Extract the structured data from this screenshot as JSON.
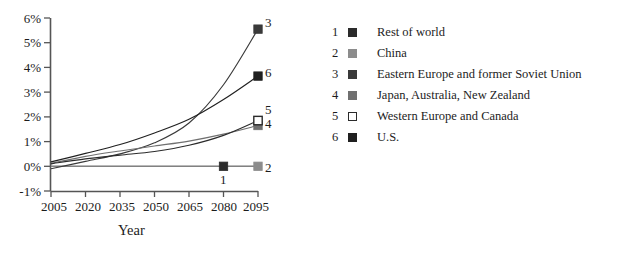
{
  "chart_data": {
    "type": "line",
    "title": "",
    "xlabel": "Year",
    "ylabel": "",
    "x": [
      2005,
      2020,
      2035,
      2050,
      2065,
      2080,
      2095
    ],
    "xlim": [
      2005,
      2095
    ],
    "ylim": [
      -1,
      6
    ],
    "yticks": [
      -1,
      0,
      1,
      2,
      3,
      4,
      5,
      6
    ],
    "ytick_labels": [
      "-1%",
      "0%",
      "1%",
      "2%",
      "3%",
      "4%",
      "5%",
      "6%"
    ],
    "xtick_labels": [
      "2005",
      "2020",
      "2035",
      "2050",
      "2065",
      "2080",
      "2095"
    ],
    "grid": false,
    "legend_position": "right",
    "series": [
      {
        "index": "1",
        "name": "Rest of world",
        "color": "#2b2b2b",
        "marker": "filled-square",
        "marker_fill": "#2b2b2b",
        "values": [
          0.0,
          0.0,
          0.0,
          0.0,
          0.0,
          0.0,
          0.0
        ],
        "end_marker_x": 2080,
        "end_marker_y": 0.0
      },
      {
        "index": "2",
        "name": "China",
        "color": "#8c8c8c",
        "marker": "filled-square",
        "marker_fill": "#8c8c8c",
        "values": [
          0.0,
          0.0,
          0.0,
          0.0,
          0.0,
          0.0,
          0.0
        ],
        "end_marker_x": 2095,
        "end_marker_y": 0.0
      },
      {
        "index": "3",
        "name": "Eastern Europe and former Soviet Union",
        "color": "#3a3a3a",
        "marker": "filled-square",
        "marker_fill": "#3a3a3a",
        "values": [
          -0.1,
          0.2,
          0.5,
          0.95,
          1.75,
          3.3,
          5.55
        ],
        "end_marker_x": 2095,
        "end_marker_y": 5.55
      },
      {
        "index": "4",
        "name": "Japan, Australia, New Zealand",
        "color": "#707070",
        "marker": "filled-square",
        "marker_fill": "#707070",
        "values": [
          0.12,
          0.4,
          0.62,
          0.82,
          1.02,
          1.3,
          1.65
        ],
        "end_marker_x": 2095,
        "end_marker_y": 1.65
      },
      {
        "index": "5",
        "name": "Western Europe and Canada",
        "color": "#2b2b2b",
        "marker": "open-square",
        "marker_fill": "#ffffff",
        "values": [
          0.1,
          0.3,
          0.45,
          0.6,
          0.85,
          1.25,
          1.85
        ],
        "end_marker_x": 2095,
        "end_marker_y": 1.85
      },
      {
        "index": "6",
        "name": "U.S.",
        "color": "#202020",
        "marker": "filled-square",
        "marker_fill": "#202020",
        "values": [
          0.18,
          0.52,
          0.88,
          1.35,
          1.9,
          2.7,
          3.65
        ],
        "end_marker_x": 2095,
        "end_marker_y": 3.65
      }
    ],
    "point_labels": [
      {
        "text": "3",
        "value": 5.55
      },
      {
        "text": "6",
        "value": 3.65
      },
      {
        "text": "5",
        "value": 1.85
      },
      {
        "text": "4",
        "value": 1.65
      },
      {
        "text": "1",
        "value": 0.0
      },
      {
        "text": "2",
        "value": 0.0
      }
    ]
  },
  "axis": {
    "x_axis_title": "Year",
    "y_tick_0": "6%",
    "y_tick_1": "5%",
    "y_tick_2": "4%",
    "y_tick_3": "3%",
    "y_tick_4": "2%",
    "y_tick_5": "1%",
    "y_tick_6": "0%",
    "y_tick_7": "-1%",
    "x_tick_0": "2005",
    "x_tick_1": "2020",
    "x_tick_2": "2035",
    "x_tick_3": "2050",
    "x_tick_4": "2065",
    "x_tick_5": "2080",
    "x_tick_6": "2095"
  },
  "plot_point_labels": {
    "l3": "3",
    "l6": "6",
    "l5": "5",
    "l4": "4",
    "l1": "1",
    "l2": "2"
  },
  "legend": {
    "items": [
      {
        "index": "1",
        "label": "Rest of world",
        "swatch": "#2b2b2b",
        "style": "filled"
      },
      {
        "index": "2",
        "label": "China",
        "swatch": "#8c8c8c",
        "style": "filled"
      },
      {
        "index": "3",
        "label": "Eastern Europe and former Soviet Union",
        "swatch": "#3a3a3a",
        "style": "filled"
      },
      {
        "index": "4",
        "label": "Japan, Australia, New Zealand",
        "swatch": "#707070",
        "style": "filled"
      },
      {
        "index": "5",
        "label": "Western Europe and Canada",
        "swatch": "#ffffff",
        "style": "open"
      },
      {
        "index": "6",
        "label": "U.S.",
        "swatch": "#202020",
        "style": "filled"
      }
    ]
  }
}
